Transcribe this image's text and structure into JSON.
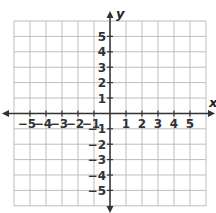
{
  "diagram": {
    "type": "coordinate-plane",
    "x_axis": {
      "label": "x",
      "min": -6,
      "max": 6,
      "tick_labels": [
        "−5",
        "−4",
        "−3",
        "−2",
        "−1",
        "1",
        "2",
        "3",
        "4",
        "5"
      ],
      "tick_values": [
        -5,
        -4,
        -3,
        -2,
        -1,
        1,
        2,
        3,
        4,
        5
      ]
    },
    "y_axis": {
      "label": "y",
      "min": -6,
      "max": 6,
      "tick_labels": [
        "5",
        "4",
        "3",
        "2",
        "1",
        "−1",
        "−2",
        "−3",
        "−4",
        "−5"
      ],
      "tick_values": [
        5,
        4,
        3,
        2,
        1,
        -1,
        -2,
        -3,
        -4,
        -5
      ]
    },
    "grid": {
      "columns": 12,
      "rows": 12,
      "left": 14,
      "top": 21,
      "cell_width": 16,
      "cell_height": 15.4
    },
    "colors": {
      "grid": "#bdbdbd",
      "axis": "#333333",
      "label": "#333333"
    }
  }
}
